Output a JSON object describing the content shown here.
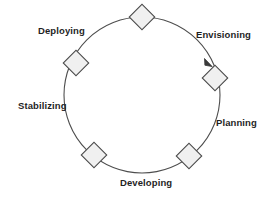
{
  "diagram": {
    "type": "cycle",
    "title": "",
    "colors": {
      "circle_stroke": "#4d4d4d",
      "node_fill": "#f0f0f0",
      "node_stroke": "#4a4a4a",
      "label_text": "#1f1f1f",
      "background": "#ffffff"
    },
    "circle": {
      "center_x": 142,
      "center_y": 95,
      "radius": 78
    },
    "arrow": {
      "name": "arrowhead-icon",
      "position_x": 211,
      "position_y": 65,
      "direction": "clockwise"
    },
    "nodes": [
      {
        "name": "node-top",
        "label": "",
        "cx": 142,
        "cy": 17,
        "size": 9
      },
      {
        "name": "node-envisioning",
        "label": "Envisioning",
        "cx": 215,
        "cy": 78,
        "size": 9
      },
      {
        "name": "node-planning",
        "label": "Planning",
        "cx": 189,
        "cy": 156,
        "size": 9
      },
      {
        "name": "node-developing",
        "label": "Developing",
        "cx": 94,
        "cy": 155,
        "size": 9
      },
      {
        "name": "node-deploying",
        "label": "Deploying",
        "cx": 76,
        "cy": 63,
        "size": 9
      }
    ],
    "labels": {
      "envisioning": "Envisioning",
      "planning": "Planning",
      "developing": "Developing",
      "stabilizing": "Stabilizing",
      "deploying": "Deploying"
    }
  }
}
